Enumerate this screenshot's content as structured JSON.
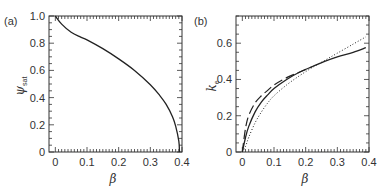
{
  "chart_data": [
    {
      "panel": "(a)",
      "type": "line",
      "xlabel": "β",
      "ylabel": "ψ_sat",
      "xlim": [
        -0.02,
        0.4
      ],
      "ylim": [
        0,
        1.0
      ],
      "xticks": [
        "0",
        "0.1",
        "0.2",
        "0.3",
        "0.4"
      ],
      "yticks": [
        "0",
        "0.2",
        "0.4",
        "0.6",
        "0.8",
        "1.0"
      ],
      "grid": false,
      "series": [
        {
          "name": "ψ_sat",
          "style": "solid",
          "x": [
            0.0,
            0.02,
            0.05,
            0.08,
            0.1,
            0.15,
            0.2,
            0.25,
            0.3,
            0.33,
            0.35,
            0.37,
            0.38,
            0.39,
            0.392
          ],
          "y": [
            1.0,
            0.94,
            0.88,
            0.845,
            0.825,
            0.76,
            0.685,
            0.6,
            0.495,
            0.415,
            0.35,
            0.26,
            0.19,
            0.08,
            0.0
          ]
        }
      ]
    },
    {
      "panel": "(b)",
      "type": "line",
      "xlabel": "β",
      "ylabel": "k_e",
      "xlim": [
        -0.02,
        0.4
      ],
      "ylim": [
        0,
        0.75
      ],
      "xticks": [
        "0",
        "0.1",
        "0.2",
        "0.3",
        "0.4"
      ],
      "yticks": [
        "0",
        "0.2",
        "0.4",
        "0.6"
      ],
      "grid": false,
      "series": [
        {
          "name": "solid",
          "style": "solid",
          "x": [
            0.0,
            0.01,
            0.02,
            0.04,
            0.06,
            0.08,
            0.1,
            0.14,
            0.18,
            0.22,
            0.26,
            0.3,
            0.35,
            0.39
          ],
          "y": [
            0.0,
            0.08,
            0.14,
            0.22,
            0.275,
            0.315,
            0.35,
            0.4,
            0.44,
            0.47,
            0.5,
            0.525,
            0.55,
            0.575
          ]
        },
        {
          "name": "dashed",
          "style": "dashed",
          "x": [
            0.0,
            0.01,
            0.02,
            0.04,
            0.06,
            0.08,
            0.1,
            0.14,
            0.18,
            0.22
          ],
          "y": [
            0.0,
            0.13,
            0.2,
            0.27,
            0.31,
            0.34,
            0.37,
            0.41,
            0.44,
            0.47
          ]
        },
        {
          "name": "dotted",
          "style": "dotted",
          "x": [
            0.0,
            0.01,
            0.02,
            0.04,
            0.06,
            0.08,
            0.1,
            0.14,
            0.18,
            0.22,
            0.26,
            0.3,
            0.35,
            0.39
          ],
          "y": [
            0.0,
            0.03,
            0.08,
            0.16,
            0.22,
            0.27,
            0.31,
            0.37,
            0.42,
            0.465,
            0.505,
            0.545,
            0.595,
            0.635
          ]
        }
      ]
    }
  ],
  "panels": {
    "a": {
      "label": "(a)",
      "xlabel": "β",
      "ylabel_main": "ψ",
      "ylabel_sub": "sat"
    },
    "b": {
      "label": "(b)",
      "xlabel": "β",
      "ylabel_main": "k",
      "ylabel_sub": "e"
    }
  }
}
